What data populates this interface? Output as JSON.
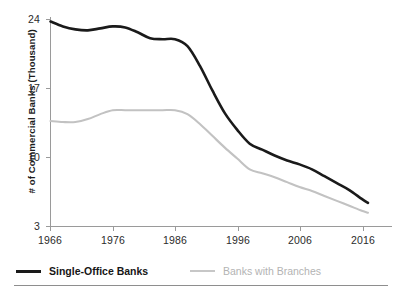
{
  "chart_data": {
    "type": "line",
    "title": "",
    "xlabel": "",
    "ylabel": "# of Commercial Banks (Thousand)",
    "xlim": [
      1966,
      2017
    ],
    "ylim": [
      3,
      24
    ],
    "xticks": [
      "1966",
      "1976",
      "1986",
      "1996",
      "2006",
      "2016"
    ],
    "yticks": [
      "24",
      "17",
      "10",
      "3"
    ],
    "grid": false,
    "legend_position": "bottom-left",
    "x": [
      1966,
      1968,
      1970,
      1972,
      1974,
      1976,
      1978,
      1980,
      1982,
      1984,
      1986,
      1988,
      1990,
      1992,
      1994,
      1996,
      1998,
      2000,
      2002,
      2004,
      2006,
      2008,
      2010,
      2012,
      2014,
      2016,
      2017
    ],
    "series": [
      {
        "name": "Single-Office Banks",
        "color": "#1a1a1a",
        "values": [
          23.8,
          23.3,
          23.0,
          22.9,
          23.1,
          23.3,
          23.2,
          22.7,
          22.1,
          22.0,
          22.0,
          21.3,
          19.3,
          16.8,
          14.5,
          12.8,
          11.4,
          10.8,
          10.2,
          9.7,
          9.3,
          8.8,
          8.1,
          7.4,
          6.7,
          5.8,
          5.4
        ]
      },
      {
        "name": "Banks with Branches",
        "color": "#c2c2c2",
        "values": [
          13.7,
          13.6,
          13.6,
          13.9,
          14.4,
          14.8,
          14.8,
          14.8,
          14.8,
          14.8,
          14.8,
          14.4,
          13.4,
          12.2,
          11.0,
          9.9,
          8.8,
          8.4,
          8.0,
          7.5,
          7.0,
          6.6,
          6.1,
          5.6,
          5.1,
          4.6,
          4.4
        ]
      }
    ]
  },
  "axes": {
    "y_title": "# of Commercial Banks (Thousand)",
    "y_tick_labels": [
      "24",
      "17",
      "10",
      "3"
    ],
    "x_tick_labels": [
      "1966",
      "1976",
      "1986",
      "1996",
      "2006",
      "2016"
    ]
  },
  "legend": {
    "items": [
      {
        "label": "Single-Office Banks",
        "color": "#1a1a1a"
      },
      {
        "label": "Banks with Branches",
        "color": "#c2c2c2"
      }
    ]
  }
}
